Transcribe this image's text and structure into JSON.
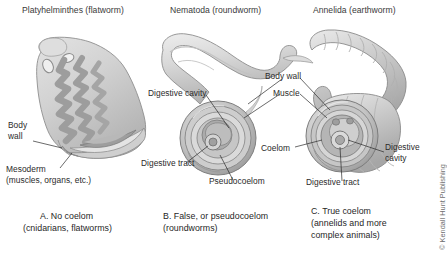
{
  "figure": {
    "background_color": "#ffffff",
    "credit": "© Kendall Hunt Publishing"
  },
  "panels": [
    {
      "id": "panel-a",
      "heading": "Platyhelminthes (flatworm)",
      "caption_line1": "A. No coelom",
      "caption_line2": "(cnidarians, flatworms)",
      "labels": [
        {
          "id": "body-wall",
          "line1": "Body",
          "line2": "wall"
        },
        {
          "id": "mesoderm",
          "line1": "Mesoderm",
          "line2": "(muscles, organs, etc.)"
        }
      ]
    },
    {
      "id": "panel-b",
      "heading": "Nematoda (roundworm)",
      "caption_line1": "B. False, or pseudocoelom",
      "caption_line2": "(roundworms)",
      "labels": [
        {
          "id": "digestive-cavity",
          "line1": "Digestive cavity"
        },
        {
          "id": "digestive-tract",
          "line1": "Digestive tract"
        },
        {
          "id": "pseudocoelom",
          "line1": "Pseudocoelom"
        },
        {
          "id": "body-wall",
          "line1": "Body wall"
        },
        {
          "id": "muscle",
          "line1": "Muscle"
        }
      ]
    },
    {
      "id": "panel-c",
      "heading": "Annelida (earthworm)",
      "caption_line1": "C. True coelom",
      "caption_line2": "(annelids and more",
      "caption_line3": "complex animals)",
      "labels": [
        {
          "id": "coelom",
          "line1": "Coelom"
        },
        {
          "id": "digestive-tract",
          "line1": "Digestive tract"
        },
        {
          "id": "digestive-cavity",
          "line1": "Digestive",
          "line2": "cavity"
        }
      ]
    }
  ],
  "colors": {
    "worm_light": "#dcdcdc",
    "worm_mid": "#bdbdbd",
    "worm_dark": "#9a9a9a",
    "worm_deep": "#7d7d7d",
    "outline": "#6a6a6a",
    "leader_line": "#2b2b2b",
    "text": "#2b2b2b",
    "credit_text": "#6e6e6e"
  }
}
